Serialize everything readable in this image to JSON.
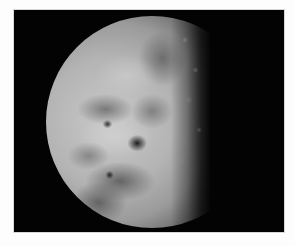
{
  "image": {
    "subject": "gibbous moon",
    "description": "Grayscale photograph of a gibbous Moon against a black sky, bordered by a thin white margin",
    "colors": {
      "border": "#fdfdfd",
      "sky": "#030303",
      "highland": "#c9c9c9",
      "mare": "#6c6c6c"
    }
  }
}
